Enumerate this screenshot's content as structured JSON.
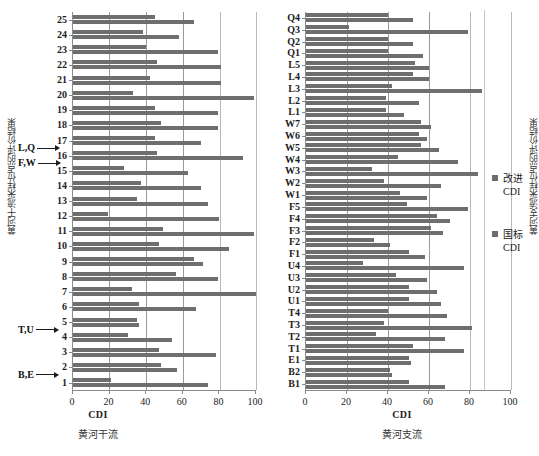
{
  "legend": {
    "series": [
      {
        "name": "improved",
        "label_cn": "改进",
        "label_unit": "CDI",
        "color": "#6e6e6e"
      },
      {
        "name": "national",
        "label_cn": "国标",
        "label_unit": "CDI",
        "color": "#6e6e6e"
      }
    ]
  },
  "panels": [
    {
      "id": "mainstream",
      "ylabel": "黄河干流采样位点的评价结果",
      "xlabel": "CDI",
      "subcaption": "黄河干流",
      "xticks": [
        "0",
        "20",
        "40",
        "60",
        "80",
        "100"
      ],
      "annotations": [
        {
          "label": "L,Q",
          "between": "16-17"
        },
        {
          "label": "F,W",
          "between": "15-16"
        },
        {
          "label": "T,U",
          "between": "4-5"
        },
        {
          "label": "B,E",
          "between": "1-2"
        }
      ]
    },
    {
      "id": "tributary",
      "ylabel": "黄河支流采样位点的评价结果",
      "xlabel": "CDI",
      "subcaption": "黄河支流",
      "xticks": [
        "0",
        "20",
        "40",
        "60",
        "80",
        "100"
      ],
      "annotations": []
    }
  ],
  "chart_data": [
    {
      "type": "bar",
      "orientation": "horizontal",
      "title": "黄河干流",
      "xlabel": "CDI",
      "ylabel": "黄河干流采样位点的评价结果",
      "xlim": [
        0,
        100
      ],
      "xticks": [
        0,
        20,
        40,
        60,
        80,
        100
      ],
      "grid": true,
      "legend_position": "right",
      "categories": [
        "25",
        "24",
        "23",
        "22",
        "21",
        "20",
        "19",
        "18",
        "17",
        "16",
        "15",
        "14",
        "13",
        "12",
        "11",
        "10",
        "9",
        "8",
        "7",
        "6",
        "5",
        "4",
        "3",
        "2",
        "1"
      ],
      "series": [
        {
          "name": "改进CDI",
          "values": [
            45,
            38,
            40,
            46,
            42,
            33,
            45,
            48,
            45,
            46,
            28,
            37,
            35,
            19,
            49,
            47,
            66,
            56,
            32,
            36,
            35,
            30,
            47,
            48,
            21
          ]
        },
        {
          "name": "国标CDI",
          "values": [
            66,
            58,
            79,
            81,
            81,
            99,
            79,
            79,
            70,
            93,
            63,
            70,
            74,
            80,
            99,
            85,
            71,
            79,
            100,
            67,
            36,
            54,
            78,
            57,
            74
          ]
        }
      ]
    },
    {
      "type": "bar",
      "orientation": "horizontal",
      "title": "黄河支流",
      "xlabel": "CDI",
      "ylabel": "黄河支流采样位点的评价结果",
      "xlim": [
        0,
        100
      ],
      "xticks": [
        0,
        20,
        40,
        60,
        80,
        100
      ],
      "grid": true,
      "legend_position": "right",
      "categories": [
        "Q4",
        "Q3",
        "Q2",
        "Q1",
        "L5",
        "L4",
        "L3",
        "L2",
        "L1",
        "W7",
        "W6",
        "W5",
        "W4",
        "W3",
        "W2",
        "W1",
        "F5",
        "F4",
        "F3",
        "F2",
        "F1",
        "U4",
        "U3",
        "U2",
        "U1",
        "T4",
        "T3",
        "T2",
        "T1",
        "E1",
        "B2",
        "B1"
      ],
      "series": [
        {
          "name": "改进CDI",
          "values": [
            40,
            21,
            40,
            40,
            53,
            52,
            42,
            39,
            39,
            56,
            55,
            56,
            45,
            32,
            38,
            46,
            49,
            64,
            61,
            33,
            50,
            28,
            44,
            50,
            50,
            40,
            38,
            34,
            52,
            50,
            41,
            50
          ]
        },
        {
          "name": "国标CDI",
          "values": [
            52,
            79,
            52,
            57,
            60,
            60,
            86,
            55,
            48,
            61,
            59,
            65,
            74,
            84,
            66,
            59,
            79,
            70,
            67,
            41,
            58,
            77,
            59,
            64,
            66,
            69,
            81,
            68,
            77,
            51,
            42,
            68
          ]
        }
      ]
    }
  ]
}
